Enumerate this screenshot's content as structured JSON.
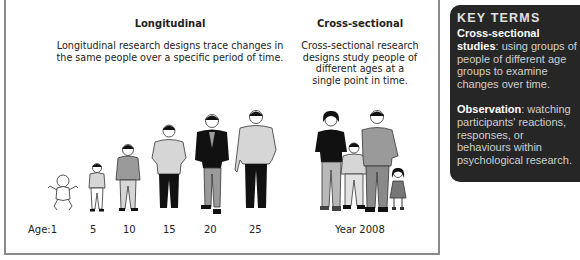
{
  "longitudinal": {
    "heading": "Longitudinal",
    "description_line1": "Longitudinal research designs trace changes in",
    "description_line2": "the same people over a specific period of time.",
    "ages": [
      "Age:1",
      "5",
      "10",
      "15",
      "20",
      "25"
    ]
  },
  "cross_sectional": {
    "heading": "Cross-sectional",
    "description_lines": [
      "Cross-sectional research",
      "designs study people of",
      "different ages at a",
      "single point in time."
    ],
    "caption": "Year 2008"
  },
  "key_terms": {
    "title": "KEY TERMS",
    "terms": [
      {
        "term": "Cross-sectional studies",
        "definition": ": using groups of people of different age groups to examine changes over time."
      },
      {
        "term": "Observation",
        "definition": ": watching participants' reactions, responses, or behaviours within psychological research."
      }
    ]
  },
  "colors": {
    "panel_bg": "#262626",
    "border": "#8a8a8a",
    "figure_dark": "#111111",
    "figure_mid": "#9a9a9a",
    "figure_light": "#d6d6d6"
  }
}
